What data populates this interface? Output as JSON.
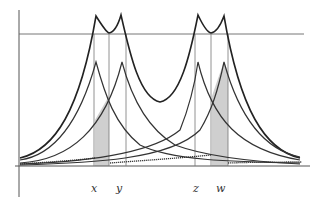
{
  "diagram": {
    "type": "overlapping-peak-curves",
    "labels": {
      "x": "x",
      "y": "y",
      "z": "z",
      "w": "w"
    },
    "colors": {
      "axis": "#555555",
      "envelope": "#222222",
      "component": "#333333",
      "dotted": "#333333",
      "shade": "#cfcfcf",
      "guide": "#777777"
    },
    "marker_positions_px": {
      "x": 94,
      "y": 118,
      "z": 196,
      "w": 220
    }
  }
}
